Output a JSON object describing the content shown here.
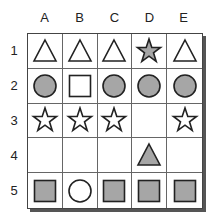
{
  "columns": [
    "A",
    "B",
    "C",
    "D",
    "E"
  ],
  "rows": [
    "1",
    "2",
    "3",
    "4",
    "5"
  ],
  "colors": {
    "fill_gray": "#a6a6a6",
    "fill_white": "#ffffff",
    "stroke": "#222222"
  },
  "grid": [
    [
      {
        "shape": "triangle",
        "fill": "white"
      },
      {
        "shape": "triangle",
        "fill": "white"
      },
      {
        "shape": "triangle",
        "fill": "white"
      },
      {
        "shape": "star",
        "fill": "gray"
      },
      {
        "shape": "triangle",
        "fill": "white"
      }
    ],
    [
      {
        "shape": "circle",
        "fill": "gray"
      },
      {
        "shape": "square",
        "fill": "white"
      },
      {
        "shape": "circle",
        "fill": "gray"
      },
      {
        "shape": "circle",
        "fill": "gray"
      },
      {
        "shape": "circle",
        "fill": "gray"
      }
    ],
    [
      {
        "shape": "star",
        "fill": "white"
      },
      {
        "shape": "star",
        "fill": "white"
      },
      {
        "shape": "star",
        "fill": "white"
      },
      {
        "shape": "none",
        "fill": ""
      },
      {
        "shape": "star",
        "fill": "white"
      }
    ],
    [
      {
        "shape": "none",
        "fill": ""
      },
      {
        "shape": "none",
        "fill": ""
      },
      {
        "shape": "none",
        "fill": ""
      },
      {
        "shape": "triangle",
        "fill": "gray"
      },
      {
        "shape": "none",
        "fill": ""
      }
    ],
    [
      {
        "shape": "square",
        "fill": "gray"
      },
      {
        "shape": "circle",
        "fill": "white"
      },
      {
        "shape": "square",
        "fill": "gray"
      },
      {
        "shape": "square",
        "fill": "gray"
      },
      {
        "shape": "square",
        "fill": "gray"
      }
    ]
  ]
}
